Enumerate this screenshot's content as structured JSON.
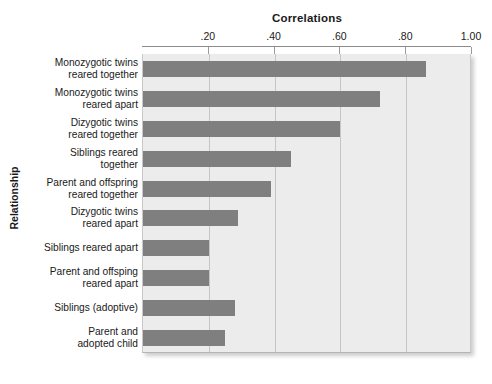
{
  "chart_data": {
    "type": "bar",
    "orientation": "horizontal",
    "title": "Correlations",
    "xlabel": "Correlations",
    "ylabel": "Relationship",
    "xlim": [
      0,
      1.0
    ],
    "xticks": [
      0.2,
      0.4,
      0.6,
      0.8,
      1.0
    ],
    "xtick_labels": [
      ".20",
      ".40",
      ".60",
      ".80",
      "1.00"
    ],
    "grid": true,
    "legend": null,
    "bar_color": "#7f7f7f",
    "plot_background": "#ececec",
    "categories": [
      "Monozygotic twins reared together",
      "Monozygotic twins reared apart",
      "Dizygotic twins reared together",
      "Siblings reared together",
      "Parent and offspring reared together",
      "Dizygotic twins reared apart",
      "Siblings reared apart",
      "Parent and offsping reared apart",
      "Siblings (adoptive)",
      "Parent and adopted child"
    ],
    "category_lines": [
      [
        "Monozygotic twins",
        "reared together"
      ],
      [
        "Monozygotic twins",
        "reared apart"
      ],
      [
        "Dizygotic twins",
        "reared together"
      ],
      [
        "Siblings reared",
        "together"
      ],
      [
        "Parent and offspring",
        "reared together"
      ],
      [
        "Dizygotic twins",
        "reared apart"
      ],
      [
        "Siblings reared apart"
      ],
      [
        "Parent and offsping",
        "reared apart"
      ],
      [
        "Siblings (adoptive)"
      ],
      [
        "Parent and",
        "adopted child"
      ]
    ],
    "values": [
      0.86,
      0.72,
      0.6,
      0.45,
      0.39,
      0.29,
      0.2,
      0.2,
      0.28,
      0.25
    ]
  }
}
